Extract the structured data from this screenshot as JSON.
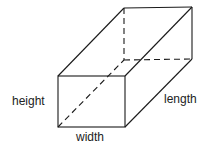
{
  "diagram": {
    "type": "rectangular-prism",
    "labels": {
      "height": "height",
      "width": "width",
      "length": "length"
    },
    "colors": {
      "stroke": "#1a1a1a",
      "text": "#222222",
      "background": "#ffffff"
    }
  }
}
